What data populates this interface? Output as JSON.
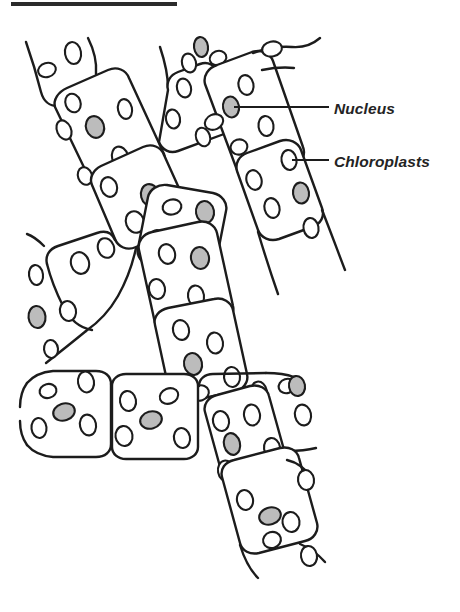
{
  "figure": {
    "kind": "biological-line-diagram",
    "background_color": "#ffffff",
    "ink_color": "#1c1c1c",
    "nucleus_fill_color": "#bcbcbc",
    "chloroplast_fill_color": "#ffffff",
    "rule_bar": {
      "present": true,
      "color": "#2b2b2b",
      "x": 11,
      "y": 2,
      "width": 166,
      "height": 4
    }
  },
  "labels": [
    {
      "id": "nucleus",
      "text": "Nucleus",
      "text_x": 334,
      "text_y": 114,
      "leader": {
        "x1": 234,
        "y1": 107,
        "x2": 329,
        "y2": 107
      },
      "points_to": {
        "x": 231,
        "y": 107,
        "structure": "nucleus"
      }
    },
    {
      "id": "chloroplasts",
      "text": "Chloroplasts",
      "text_x": 334,
      "text_y": 167,
      "leader": {
        "x1": 292,
        "y1": 160,
        "x2": 329,
        "y2": 160
      },
      "points_to": {
        "x": 289,
        "y": 160,
        "structure": "chloroplast"
      }
    }
  ],
  "filaments": [
    {
      "id": "upper-left-filament",
      "orientation": "diagonal-down-right",
      "cell_count": 3
    },
    {
      "id": "upper-right-filament",
      "orientation": "diagonal-down-left",
      "cell_count": 4
    },
    {
      "id": "central-filament",
      "orientation": "diagonal-down-right",
      "cell_count": 3
    },
    {
      "id": "bottom-horizontal-filament",
      "orientation": "horizontal",
      "cell_count": 3
    },
    {
      "id": "lower-right-filament",
      "orientation": "diagonal-down-right",
      "cell_count": 3
    }
  ],
  "counts": {
    "cells_visible": 16,
    "nuclei_visible": 14,
    "chloroplasts_visible": 58
  }
}
